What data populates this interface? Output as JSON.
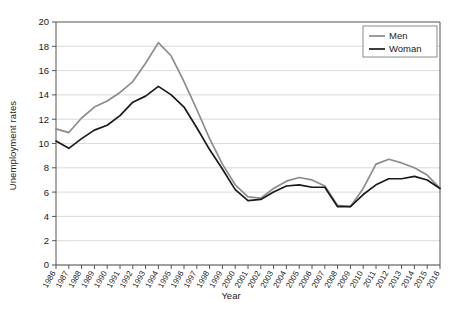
{
  "chart_data": {
    "type": "line",
    "title": "",
    "xlabel": "Year",
    "ylabel": "Unemployment rates",
    "xlim": [
      1986,
      2016
    ],
    "ylim": [
      0,
      20
    ],
    "ytick_step": 2,
    "yticks": [
      0,
      2,
      4,
      6,
      8,
      10,
      12,
      14,
      16,
      18,
      20
    ],
    "grid": "horizontal",
    "legend_position": "top-right",
    "categories": [
      "1986",
      "1987",
      "1988",
      "1989",
      "1990",
      "1991",
      "1992",
      "1993",
      "1994",
      "1995",
      "1996",
      "1997",
      "1998",
      "1999",
      "2000",
      "2001",
      "2002",
      "2003",
      "2004",
      "2005",
      "2006",
      "2007",
      "2008",
      "2009",
      "2010",
      "2011",
      "2012",
      "2013",
      "2014",
      "2015",
      "2016"
    ],
    "series": [
      {
        "name": "Men",
        "color": "#8c8c8c",
        "values": [
          11.2,
          10.9,
          12.1,
          13.0,
          13.5,
          14.2,
          15.1,
          16.6,
          18.3,
          17.2,
          15.1,
          12.8,
          10.4,
          8.3,
          6.6,
          5.6,
          5.5,
          6.3,
          6.9,
          7.2,
          7.0,
          6.5,
          4.9,
          4.8,
          6.3,
          8.3,
          8.7,
          8.4,
          8.0,
          7.4,
          6.3
        ]
      },
      {
        "name": "Woman",
        "color": "#1a1a1a",
        "values": [
          10.2,
          9.6,
          10.4,
          11.1,
          11.5,
          12.3,
          13.4,
          13.9,
          14.7,
          14.0,
          13.0,
          11.3,
          9.5,
          7.9,
          6.2,
          5.3,
          5.4,
          6.0,
          6.5,
          6.6,
          6.4,
          6.4,
          4.8,
          4.8,
          5.8,
          6.6,
          7.1,
          7.1,
          7.3,
          7.0,
          6.3
        ]
      }
    ]
  },
  "legend": {
    "items": [
      {
        "label": "Men"
      },
      {
        "label": "Woman"
      }
    ]
  },
  "axis": {
    "y_title": "Unemployment rates",
    "x_title": "Year"
  }
}
